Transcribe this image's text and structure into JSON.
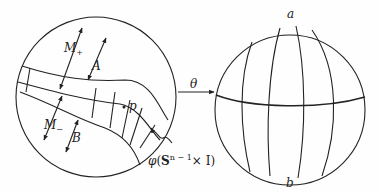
{
  "figure": {
    "left_sphere": {
      "labels": {
        "m_plus": "M",
        "m_plus_sub": "+",
        "m_minus": "M",
        "m_minus_sub": "−",
        "a_region": "A",
        "b_region": "B",
        "point": "p",
        "band_phi": "φ",
        "band_open": "(",
        "band_S": "S",
        "band_sup": "n − 1",
        "band_times": "× I)"
      }
    },
    "map_arrow": {
      "label": "θ"
    },
    "right_sphere": {
      "labels": {
        "north_pole": "a",
        "south_pole": "b"
      }
    }
  }
}
